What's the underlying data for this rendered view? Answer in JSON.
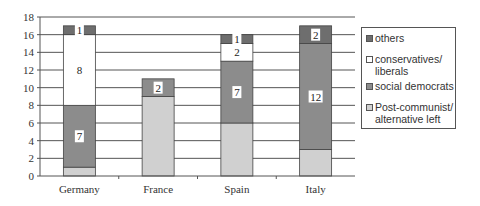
{
  "chart_data": {
    "type": "bar",
    "stacked": true,
    "title": "",
    "xlabel": "",
    "ylabel": "",
    "ylim": [
      0,
      18
    ],
    "yticks": [
      0,
      2,
      4,
      6,
      8,
      10,
      12,
      14,
      16,
      18
    ],
    "grid": true,
    "legend_position": "right",
    "categories": [
      "Germany",
      "France",
      "Spain",
      "Italy"
    ],
    "series": [
      {
        "name": "Post-communist/ alternative left",
        "color": "#d0d0d0",
        "values": [
          1,
          9,
          6,
          3
        ],
        "labels": [
          null,
          null,
          null,
          null
        ]
      },
      {
        "name": "social democrats",
        "color": "#8c8c8c",
        "values": [
          7,
          2,
          7,
          12
        ],
        "labels": [
          "7",
          "2",
          "7",
          "12"
        ]
      },
      {
        "name": "conservatives/ liberals",
        "color": "#ffffff",
        "values": [
          8,
          0,
          2,
          0
        ],
        "labels": [
          "8",
          null,
          "2",
          null
        ]
      },
      {
        "name": "others",
        "color": "#6e6e6e",
        "values": [
          1,
          0,
          1,
          2
        ],
        "labels": [
          "1",
          null,
          "1",
          "2"
        ]
      }
    ]
  },
  "legend": {
    "items": [
      {
        "label": "others",
        "color": "#6e6e6e"
      },
      {
        "label": "conservatives/\nliberals",
        "color": "#ffffff"
      },
      {
        "label": "social democrats",
        "color": "#8c8c8c"
      },
      {
        "label": "Post-communist/\nalternative left",
        "color": "#d0d0d0"
      }
    ]
  }
}
